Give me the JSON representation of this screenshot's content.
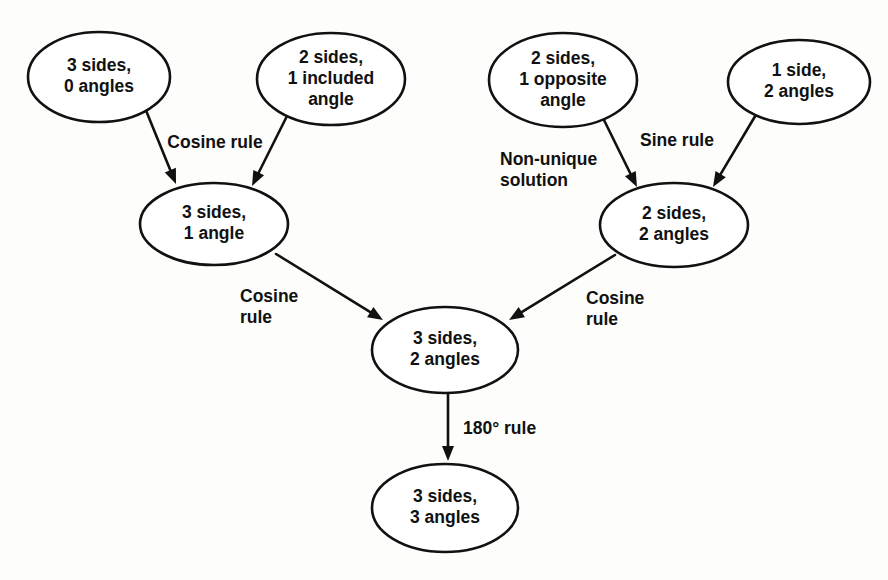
{
  "diagram": {
    "colors": {
      "background": "#fdfdfb",
      "stroke": "#111111",
      "node_fill": "#ffffff",
      "text": "#111111"
    },
    "nodes": [
      {
        "id": "three-sides-zero-angles",
        "lines": [
          "3 sides,",
          "0 angles"
        ],
        "cx": 99,
        "cy": 77,
        "rx": 71,
        "ry": 45
      },
      {
        "id": "two-sides-one-included-angle",
        "lines": [
          "2 sides,",
          "1 included",
          "angle"
        ],
        "cx": 331,
        "cy": 79,
        "rx": 74,
        "ry": 46
      },
      {
        "id": "two-sides-one-opposite-angle",
        "lines": [
          "2 sides,",
          "1 opposite",
          "angle"
        ],
        "cx": 563,
        "cy": 80,
        "rx": 74,
        "ry": 47
      },
      {
        "id": "one-side-two-angles",
        "lines": [
          "1 side,",
          "2 angles"
        ],
        "cx": 799,
        "cy": 82,
        "rx": 71,
        "ry": 42
      },
      {
        "id": "three-sides-one-angle",
        "lines": [
          "3 sides,",
          "1 angle"
        ],
        "cx": 214,
        "cy": 224,
        "rx": 74,
        "ry": 41
      },
      {
        "id": "two-sides-two-angles",
        "lines": [
          "2 sides,",
          "2 angles"
        ],
        "cx": 674,
        "cy": 225,
        "rx": 74,
        "ry": 42
      },
      {
        "id": "three-sides-two-angles",
        "lines": [
          "3 sides,",
          "2 angles"
        ],
        "cx": 445,
        "cy": 350,
        "rx": 73,
        "ry": 43
      },
      {
        "id": "three-sides-three-angles",
        "lines": [
          "3 sides,",
          "3 angles"
        ],
        "cx": 445,
        "cy": 508,
        "rx": 73,
        "ry": 44
      }
    ],
    "edges": [
      {
        "id": "edge-cosine-rule-left-a",
        "from": "three-sides-zero-angles",
        "to": "three-sides-one-angle",
        "x1": 145,
        "y1": 108,
        "x2": 176,
        "y2": 184
      },
      {
        "id": "edge-cosine-rule-left-b",
        "from": "two-sides-one-included-angle",
        "to": "three-sides-one-angle",
        "x1": 289,
        "y1": 112,
        "x2": 252,
        "y2": 186
      },
      {
        "id": "edge-non-unique-solution",
        "from": "two-sides-one-opposite-angle",
        "to": "two-sides-two-angles",
        "x1": 602,
        "y1": 116,
        "x2": 637,
        "y2": 187
      },
      {
        "id": "edge-sine-rule",
        "from": "one-side-two-angles",
        "to": "two-sides-two-angles",
        "x1": 757,
        "y1": 113,
        "x2": 713,
        "y2": 187
      },
      {
        "id": "edge-cosine-rule-mid-left",
        "from": "three-sides-one-angle",
        "to": "three-sides-two-angles",
        "x1": 276,
        "y1": 254,
        "x2": 383,
        "y2": 320
      },
      {
        "id": "edge-cosine-rule-mid-right",
        "from": "two-sides-two-angles",
        "to": "three-sides-two-angles",
        "x1": 615,
        "y1": 255,
        "x2": 509,
        "y2": 320
      },
      {
        "id": "edge-180-rule",
        "from": "three-sides-two-angles",
        "to": "three-sides-three-angles",
        "x1": 448,
        "y1": 394,
        "x2": 448,
        "y2": 461
      }
    ],
    "edge_labels": [
      {
        "id": "label-cosine-rule-top",
        "lines": [
          "Cosine rule"
        ],
        "x": 215,
        "y": 143,
        "anchor": "middle"
      },
      {
        "id": "label-non-unique-solution",
        "lines": [
          "Non-unique",
          "solution"
        ],
        "x": 500,
        "y": 160,
        "anchor": "start"
      },
      {
        "id": "label-sine-rule",
        "lines": [
          "Sine rule"
        ],
        "x": 640,
        "y": 141,
        "anchor": "start"
      },
      {
        "id": "label-cosine-rule-left",
        "lines": [
          "Cosine",
          "rule"
        ],
        "x": 240,
        "y": 297,
        "anchor": "start"
      },
      {
        "id": "label-cosine-rule-right",
        "lines": [
          "Cosine",
          "rule"
        ],
        "x": 586,
        "y": 299,
        "anchor": "start"
      },
      {
        "id": "label-180-rule",
        "lines": [
          "180° rule"
        ],
        "x": 463,
        "y": 429,
        "anchor": "start"
      }
    ]
  }
}
